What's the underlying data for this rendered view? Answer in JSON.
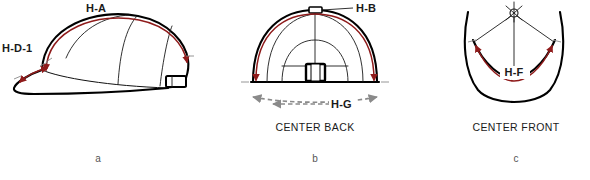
{
  "figure": {
    "background_color": "#ffffff",
    "accent_color": "#8f1b1b",
    "outline_color": "#000000",
    "dimension_guide_color": "#8a8a8a"
  },
  "panels": [
    {
      "letter": "a",
      "view": "side",
      "view_label": "",
      "dimensions": [
        {
          "code": "H-A",
          "description": "crown arc over top, side view"
        },
        {
          "code": "H-D-1",
          "description": "visor edge length"
        }
      ],
      "features": [
        "crown-panel-seams",
        "visor",
        "back-closure-buckle"
      ]
    },
    {
      "letter": "b",
      "view": "back",
      "view_label": "CENTER BACK",
      "dimensions": [
        {
          "code": "H-B",
          "description": "crown arc over top, back view"
        },
        {
          "code": "H-G",
          "description": "sweatband width across back"
        }
      ],
      "features": [
        "crown-panel-seams",
        "back-closure-buckle",
        "sweatband-baseline"
      ]
    },
    {
      "letter": "c",
      "view": "front",
      "view_label": "CENTER FRONT",
      "dimensions": [
        {
          "code": "H-F",
          "description": "front crown seam arc"
        }
      ],
      "features": [
        "button-eyelet",
        "front-panel-seams",
        "visor-curve"
      ]
    }
  ],
  "labels": {
    "h_a": "H-A",
    "h_d_1": "H-D-1",
    "h_b": "H-B",
    "h_g": "H-G",
    "h_f": "H-F",
    "center_back": "CENTER BACK",
    "center_front": "CENTER FRONT",
    "letter_a": "a",
    "letter_b": "b",
    "letter_c": "c"
  }
}
